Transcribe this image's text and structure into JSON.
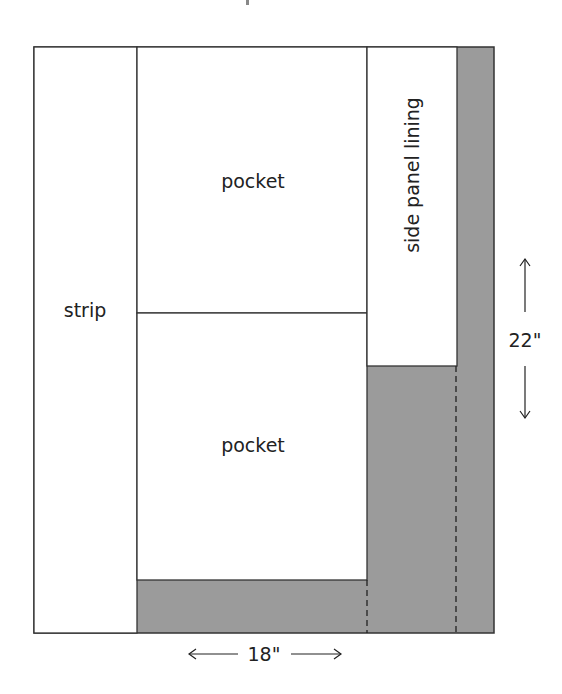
{
  "diagram": {
    "title_fragment": "",
    "colors": {
      "fabric_grey": "#9b9b9b",
      "outline": "#333333",
      "background": "#ffffff"
    },
    "pieces": [
      {
        "id": "strip",
        "label": "strip"
      },
      {
        "id": "pocket-top",
        "label": "pocket"
      },
      {
        "id": "pocket-bottom",
        "label": "pocket"
      },
      {
        "id": "side-panel-lining",
        "label": "side panel lining"
      }
    ],
    "dimensions": {
      "width": {
        "label": "18\"",
        "arrow_left": "←",
        "arrow_right": "→"
      },
      "height": {
        "label": "22\"",
        "arrow_up": "↑",
        "arrow_down": "↓"
      }
    }
  }
}
